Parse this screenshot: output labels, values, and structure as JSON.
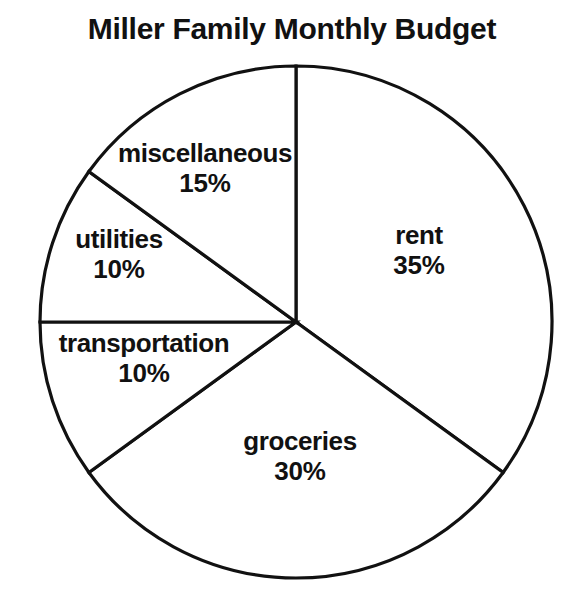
{
  "chart": {
    "title": "Miller Family Monthly Budget"
  },
  "chart_data": {
    "type": "pie",
    "title": "Miller Family Monthly Budget",
    "xlabel": "",
    "ylabel": "",
    "legend_position": "none",
    "grid": false,
    "unit": "%",
    "start_angle_deg": 0,
    "direction": "clockwise",
    "categories": [
      "rent",
      "groceries",
      "transportation",
      "utilities",
      "miscellaneous"
    ],
    "values": [
      35,
      30,
      10,
      10,
      15
    ],
    "slices": [
      {
        "label": "rent",
        "value": 35,
        "value_label": "35%",
        "start_deg": 0,
        "end_deg": 126,
        "color": "#ffffff",
        "stroke": "#111111"
      },
      {
        "label": "groceries",
        "value": 30,
        "value_label": "30%",
        "start_deg": 126,
        "end_deg": 234,
        "color": "#ffffff",
        "stroke": "#111111"
      },
      {
        "label": "transportation",
        "value": 10,
        "value_label": "10%",
        "start_deg": 234,
        "end_deg": 270,
        "color": "#ffffff",
        "stroke": "#111111"
      },
      {
        "label": "utilities",
        "value": 10,
        "value_label": "10%",
        "start_deg": 270,
        "end_deg": 306,
        "color": "#ffffff",
        "stroke": "#111111"
      },
      {
        "label": "miscellaneous",
        "value": 15,
        "value_label": "15%",
        "start_deg": 306,
        "end_deg": 360,
        "color": "#ffffff",
        "stroke": "#111111"
      }
    ],
    "total": 100
  },
  "geometry": {
    "center_x": 296,
    "center_y": 322,
    "radius": 256
  },
  "colors": {
    "ink": "#111111",
    "background": "#ffffff"
  }
}
